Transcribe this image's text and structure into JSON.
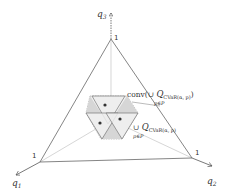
{
  "diagram": {
    "axes": [
      {
        "name": "q1",
        "label": "q",
        "sub": "1"
      },
      {
        "name": "q2",
        "label": "q",
        "sub": "2"
      },
      {
        "name": "q3",
        "label": "q",
        "sub": "3"
      }
    ],
    "vertex_labels": {
      "top": "1",
      "left": "1",
      "right": "1"
    },
    "annotations": {
      "conv": {
        "prefix": "conv(∪ ",
        "Q": "Q",
        "sub": "CVaR(α, p)",
        "close": ")",
        "under": "p∈P"
      },
      "union": {
        "prefix": "∪ ",
        "Q": "Q",
        "sub": "CVaR(α, p)",
        "under": "p∈P"
      }
    },
    "colors": {
      "line": "#555555",
      "faint": "#bbbbbb",
      "fill_light": "#ececec",
      "fill_dark": "#cfcfcf",
      "dot": "#333333"
    }
  }
}
